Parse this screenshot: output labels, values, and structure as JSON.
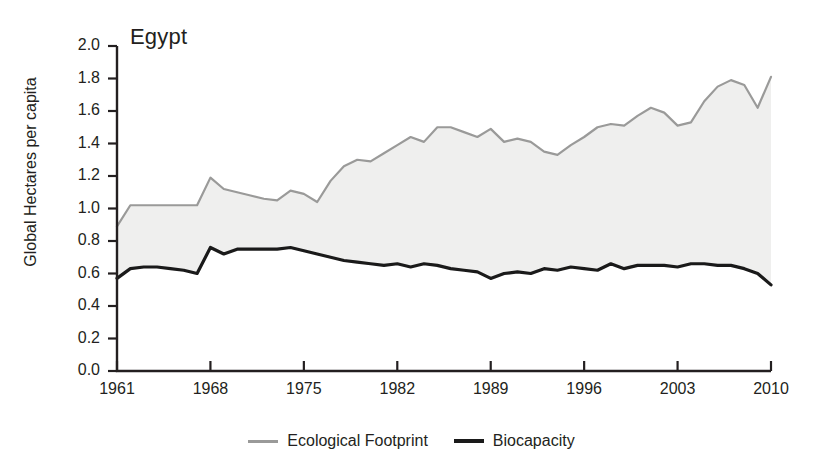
{
  "chart_data": {
    "type": "area",
    "title": "Egypt",
    "xlabel": "",
    "ylabel": "Global Hectares per capita",
    "xlim": [
      1961,
      2010
    ],
    "ylim": [
      0.0,
      2.0
    ],
    "grid": false,
    "legend_position": "bottom-center",
    "xticks": [
      "1961",
      "1968",
      "1975",
      "1982",
      "1989",
      "1996",
      "2003",
      "2010"
    ],
    "xtick_values": [
      1961,
      1968,
      1975,
      1982,
      1989,
      1996,
      2003,
      2010
    ],
    "yticks": [
      "0.0",
      "0.2",
      "0.4",
      "0.6",
      "0.8",
      "1.0",
      "1.2",
      "1.4",
      "1.6",
      "1.8",
      "2.0"
    ],
    "ytick_values": [
      0.0,
      0.2,
      0.4,
      0.6,
      0.8,
      1.0,
      1.2,
      1.4,
      1.6,
      1.8,
      2.0
    ],
    "x": [
      1961,
      1962,
      1963,
      1964,
      1965,
      1966,
      1967,
      1968,
      1969,
      1970,
      1971,
      1972,
      1973,
      1974,
      1975,
      1976,
      1977,
      1978,
      1979,
      1980,
      1981,
      1982,
      1983,
      1984,
      1985,
      1986,
      1987,
      1988,
      1989,
      1990,
      1991,
      1992,
      1993,
      1994,
      1995,
      1996,
      1997,
      1998,
      1999,
      2000,
      2001,
      2002,
      2003,
      2004,
      2005,
      2006,
      2007,
      2008,
      2009,
      2010
    ],
    "series": [
      {
        "name": "Ecological Footprint",
        "color": "#9a9a99",
        "values": [
          0.89,
          1.02,
          1.02,
          1.02,
          1.02,
          1.02,
          1.02,
          1.19,
          1.12,
          1.1,
          1.08,
          1.06,
          1.05,
          1.11,
          1.09,
          1.04,
          1.17,
          1.26,
          1.3,
          1.29,
          1.34,
          1.39,
          1.44,
          1.41,
          1.5,
          1.5,
          1.47,
          1.44,
          1.49,
          1.41,
          1.43,
          1.41,
          1.35,
          1.33,
          1.39,
          1.44,
          1.5,
          1.52,
          1.51,
          1.57,
          1.62,
          1.59,
          1.51,
          1.53,
          1.66,
          1.75,
          1.79,
          1.76,
          1.62,
          1.81
        ]
      },
      {
        "name": "Biocapacity",
        "color": "#1a1a1a",
        "values": [
          0.57,
          0.63,
          0.64,
          0.64,
          0.63,
          0.62,
          0.6,
          0.76,
          0.72,
          0.75,
          0.75,
          0.75,
          0.75,
          0.76,
          0.74,
          0.72,
          0.7,
          0.68,
          0.67,
          0.66,
          0.65,
          0.66,
          0.64,
          0.66,
          0.65,
          0.63,
          0.62,
          0.61,
          0.57,
          0.6,
          0.61,
          0.6,
          0.63,
          0.62,
          0.64,
          0.63,
          0.62,
          0.66,
          0.63,
          0.65,
          0.65,
          0.65,
          0.64,
          0.66,
          0.66,
          0.65,
          0.65,
          0.63,
          0.6,
          0.53
        ]
      }
    ],
    "fill": {
      "between": [
        "Ecological Footprint",
        "Biocapacity"
      ],
      "color": "#efefee"
    }
  },
  "legend": {
    "items": [
      {
        "label": "Ecological Footprint",
        "key": "ef"
      },
      {
        "label": "Biocapacity",
        "key": "bc"
      }
    ]
  }
}
